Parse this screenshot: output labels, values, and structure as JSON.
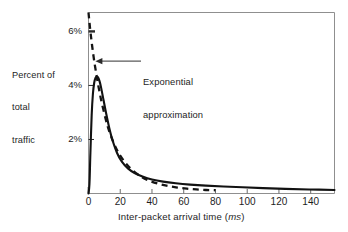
{
  "figure": {
    "background": "#ffffff",
    "ink_color": "#1d1d1d",
    "frame_color": "#8a8a8a"
  },
  "chart_data": {
    "type": "line",
    "title": "",
    "xlabel_prefix": "Inter-packet arrival time (",
    "xlabel_unit": "ms",
    "xlabel_suffix": ")",
    "ylabel_lines": [
      "Percent of",
      "total",
      "traffic"
    ],
    "xlim": [
      0,
      155
    ],
    "ylim": [
      0,
      6.7
    ],
    "grid": false,
    "legend_position": "none",
    "xticks": [
      0,
      20,
      40,
      60,
      80,
      100,
      120,
      140
    ],
    "xtick_labels": [
      "0",
      "20",
      "40",
      "60",
      "80",
      "100",
      "120",
      "140"
    ],
    "yticks": [
      2,
      4,
      6
    ],
    "ytick_labels": [
      "2%",
      "4%",
      "6%"
    ],
    "annotations": [
      {
        "name": "exponential-approximation-callout",
        "lines": [
          "Exponential",
          "approximation"
        ],
        "points_to_x": 4,
        "points_to_y": 4.9
      }
    ],
    "series": [
      {
        "name": "Measured traffic",
        "style": "solid",
        "x": [
          0,
          0.6,
          1.2,
          2,
          2.8,
          3.6,
          4.4,
          5.2,
          6,
          7,
          8,
          9.5,
          11,
          13,
          15,
          18,
          21,
          25,
          29,
          34,
          40,
          47,
          55,
          64,
          74,
          85,
          97,
          110,
          124,
          139,
          155
        ],
        "y": [
          0,
          0.35,
          1.5,
          2.9,
          3.7,
          4.1,
          4.28,
          4.32,
          4.3,
          4.15,
          3.9,
          3.45,
          3.0,
          2.45,
          2.0,
          1.5,
          1.18,
          0.92,
          0.76,
          0.63,
          0.52,
          0.44,
          0.38,
          0.33,
          0.29,
          0.26,
          0.23,
          0.2,
          0.17,
          0.15,
          0.13
        ]
      },
      {
        "name": "Exponential approximation",
        "style": "dashed",
        "x": [
          0,
          1,
          2,
          3,
          4,
          5,
          6,
          7,
          8,
          10,
          12,
          14,
          17,
          20,
          24,
          28,
          33,
          38,
          44,
          50,
          56,
          62,
          68,
          74,
          80
        ],
        "y": [
          6.7,
          6.1,
          5.6,
          5.15,
          4.75,
          4.4,
          4.05,
          3.75,
          3.45,
          2.95,
          2.5,
          2.15,
          1.72,
          1.4,
          1.08,
          0.85,
          0.63,
          0.48,
          0.36,
          0.28,
          0.22,
          0.18,
          0.15,
          0.13,
          0.12
        ]
      }
    ]
  }
}
